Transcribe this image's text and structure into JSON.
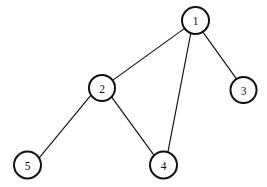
{
  "diagram": {
    "type": "undirected-graph",
    "title": "",
    "width": 267,
    "height": 187,
    "background_color": "#ffffff",
    "stroke_color": "#111111",
    "node_fill_color": "#ffffff",
    "node_stroke_width": 2,
    "edge_stroke_width": 1.15,
    "nodes": [
      {
        "id": "1",
        "label": "1",
        "cx": 195.5,
        "cy": 20.5,
        "r": 13.5
      },
      {
        "id": "2",
        "label": "2",
        "cx": 102.0,
        "cy": 88.0,
        "r": 13.0
      },
      {
        "id": "3",
        "label": "3",
        "cx": 243.5,
        "cy": 90.0,
        "r": 13.0
      },
      {
        "id": "4",
        "label": "4",
        "cx": 163.5,
        "cy": 165.0,
        "r": 13.5
      },
      {
        "id": "5",
        "label": "5",
        "cx": 27.5,
        "cy": 165.0,
        "r": 13.5
      }
    ],
    "edges": [
      {
        "id": "edge-1-2",
        "source": "1",
        "target": "2",
        "x1": 184.6,
        "y1": 28.4,
        "x2": 112.9,
        "y2": 80.1
      },
      {
        "id": "edge-1-3",
        "source": "1",
        "target": "3",
        "x1": 202.8,
        "y1": 31.9,
        "x2": 236.3,
        "y2": 78.7
      },
      {
        "id": "edge-1-4",
        "source": "1",
        "target": "4",
        "x1": 190.8,
        "y1": 33.2,
        "x2": 167.9,
        "y2": 152.2
      },
      {
        "id": "edge-2-4",
        "source": "2",
        "target": "4",
        "x1": 111.9,
        "y1": 97.4,
        "x2": 154.1,
        "y2": 155.3
      },
      {
        "id": "edge-2-5",
        "source": "2",
        "target": "5",
        "x1": 91.0,
        "y1": 95.1,
        "x2": 38.8,
        "y2": 158.4
      }
    ],
    "adjacency_list": {
      "1": [
        "2",
        "3",
        "4"
      ],
      "2": [
        "1",
        "4",
        "5"
      ],
      "3": [
        "1"
      ],
      "4": [
        "1",
        "2"
      ],
      "5": [
        "2"
      ]
    }
  }
}
